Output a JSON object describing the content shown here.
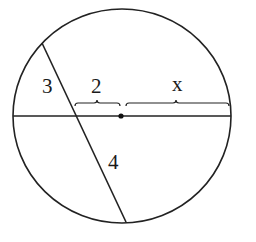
{
  "diagram": {
    "type": "intersecting-chords-in-circle",
    "stroke_color": "#222222",
    "circle": {
      "cx": 122,
      "cy": 116,
      "rx": 109,
      "ry": 107
    },
    "horizontal_chord": {
      "x1": 13,
      "y1": 116,
      "x2": 231,
      "y2": 116
    },
    "slanted_chord": {
      "x1": 42,
      "y1": 43,
      "x2": 126,
      "y2": 222
    },
    "center_point": {
      "cx": 121,
      "cy": 116,
      "r": 2.5
    },
    "labels": {
      "segment_upper_slanted": "3",
      "segment_left_horizontal": "2",
      "segment_right_horizontal": "x",
      "segment_lower_slanted": "4"
    }
  }
}
